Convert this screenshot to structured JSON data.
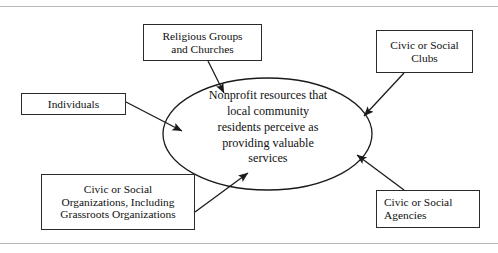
{
  "figure": {
    "type": "concept-diagram",
    "center": {
      "shape": "ellipse",
      "lines": [
        "Nonprofit resources that",
        "local community",
        "residents perceive as",
        "providing valuable",
        "services"
      ],
      "text": "Nonprofit resources that local community residents perceive as providing valuable services"
    },
    "nodes": [
      {
        "id": "religious",
        "lines": [
          "Religious Groups",
          "and Churches"
        ],
        "text": "Religious Groups and Churches",
        "position": "top-left-of-center",
        "align": "center"
      },
      {
        "id": "clubs",
        "lines": [
          "Civic or Social",
          "Clubs"
        ],
        "text": "Civic or Social Clubs",
        "position": "top-right",
        "align": "center"
      },
      {
        "id": "individuals",
        "lines": [
          "Individuals"
        ],
        "text": "Individuals",
        "position": "left",
        "align": "center"
      },
      {
        "id": "organizations",
        "lines": [
          "Civic or Social",
          "Organizations, Including",
          "Grassroots Organizations"
        ],
        "text": "Civic or Social Organizations, Including Grassroots Organizations",
        "position": "bottom-left",
        "align": "center"
      },
      {
        "id": "agencies",
        "lines": [
          "Civic or Social",
          "Agencies"
        ],
        "text": "Civic or Social Agencies",
        "position": "bottom-right",
        "align": "left"
      }
    ],
    "edges": [
      {
        "from": "religious",
        "to": "center",
        "arrow": "to-center"
      },
      {
        "from": "clubs",
        "to": "center",
        "arrow": "to-center"
      },
      {
        "from": "individuals",
        "to": "center",
        "arrow": "to-center"
      },
      {
        "from": "organizations",
        "to": "center",
        "arrow": "to-center"
      },
      {
        "from": "agencies",
        "to": "center",
        "arrow": "to-center"
      }
    ]
  },
  "colors": {
    "stroke": "#2b2b2b",
    "rule": "#b9b9b9",
    "background": "#ffffff",
    "text": "#101010"
  }
}
